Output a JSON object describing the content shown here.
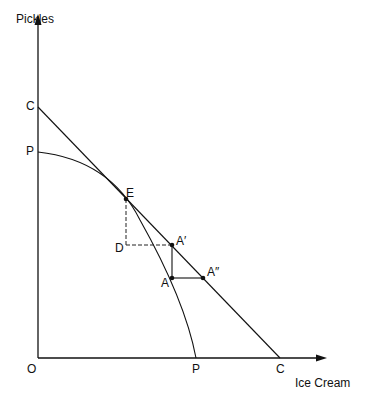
{
  "axes": {
    "y_label": "Pickles",
    "x_label": "Ice Cream",
    "origin_label": "O"
  },
  "points": {
    "C_y": "C",
    "P_y": "P",
    "E": "E",
    "D": "D",
    "A_prime": "A′",
    "A": "A",
    "A_double_prime": "A″",
    "P_x": "P",
    "C_x": "C"
  },
  "curves": {
    "production_possibility_frontier": "P–P (bowed outward)",
    "consumption_line": "C–C (straight line tangent at E)"
  },
  "colors": {
    "line": "#111111",
    "background": "#ffffff"
  }
}
